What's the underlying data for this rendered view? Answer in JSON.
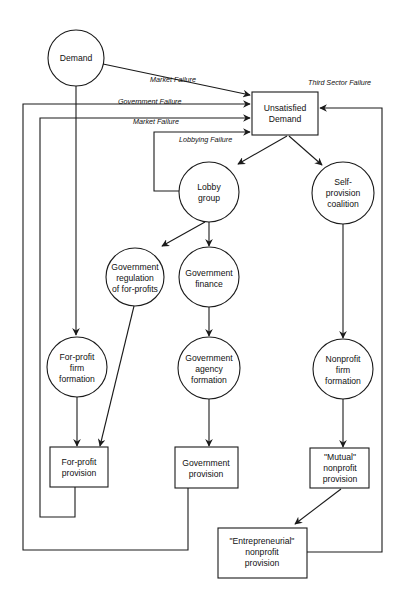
{
  "diagram": {
    "nodes": {
      "demand": {
        "label": [
          "Demand"
        ],
        "shape": "circle"
      },
      "unsatisfied_demand": {
        "label": [
          "Unsatisfied",
          "Demand"
        ],
        "shape": "box"
      },
      "lobby_group": {
        "label": [
          "Lobby",
          "group"
        ],
        "shape": "circle"
      },
      "self_provision": {
        "label": [
          "Self-",
          "provision",
          "coalition"
        ],
        "shape": "circle"
      },
      "gov_regulation": {
        "label": [
          "Government",
          "regulation",
          "of for-profits"
        ],
        "shape": "circle"
      },
      "gov_finance": {
        "label": [
          "Government",
          "finance"
        ],
        "shape": "circle"
      },
      "forprofit_formation": {
        "label": [
          "For-profit",
          "firm",
          "formation"
        ],
        "shape": "circle"
      },
      "gov_agency_formation": {
        "label": [
          "Government",
          "agency",
          "formation"
        ],
        "shape": "circle"
      },
      "nonprofit_formation": {
        "label": [
          "Nonprofit",
          "firm",
          "formation"
        ],
        "shape": "circle"
      },
      "forprofit_provision": {
        "label": [
          "For-profit",
          "provision"
        ],
        "shape": "box"
      },
      "gov_provision": {
        "label": [
          "Government",
          "provision"
        ],
        "shape": "box"
      },
      "mutual_provision": {
        "label": [
          "\"Mutual\"",
          "nonprofit",
          "provision"
        ],
        "shape": "box"
      },
      "entrepreneurial_provision": {
        "label": [
          "\"Entrepreneurial\"",
          "nonprofit",
          "provision"
        ],
        "shape": "box"
      }
    },
    "edge_labels": {
      "market_failure_1": "Market Failure",
      "government_failure": "Government Failure",
      "market_failure_2": "Market Failure",
      "lobbying_failure": "Lobbying Failure",
      "third_sector_failure": "Third Sector Failure"
    },
    "edges": [
      {
        "from": "demand",
        "to": "unsatisfied_demand",
        "label": "Market Failure"
      },
      {
        "from": "demand",
        "to": "forprofit_formation"
      },
      {
        "from": "gov_provision",
        "to": "unsatisfied_demand",
        "label": "Government Failure"
      },
      {
        "from": "forprofit_provision",
        "to": "unsatisfied_demand",
        "label": "Market Failure"
      },
      {
        "from": "lobby_group",
        "to": "unsatisfied_demand",
        "label": "Lobbying Failure"
      },
      {
        "from": "entrepreneurial_provision",
        "to": "unsatisfied_demand",
        "label": "Third Sector Failure"
      },
      {
        "from": "unsatisfied_demand",
        "to": "lobby_group"
      },
      {
        "from": "unsatisfied_demand",
        "to": "self_provision"
      },
      {
        "from": "lobby_group",
        "to": "gov_regulation"
      },
      {
        "from": "lobby_group",
        "to": "gov_finance"
      },
      {
        "from": "gov_regulation",
        "to": "forprofit_provision"
      },
      {
        "from": "gov_finance",
        "to": "gov_agency_formation"
      },
      {
        "from": "forprofit_formation",
        "to": "forprofit_provision"
      },
      {
        "from": "gov_agency_formation",
        "to": "gov_provision"
      },
      {
        "from": "self_provision",
        "to": "nonprofit_formation"
      },
      {
        "from": "nonprofit_formation",
        "to": "mutual_provision"
      },
      {
        "from": "mutual_provision",
        "to": "entrepreneurial_provision"
      }
    ]
  }
}
